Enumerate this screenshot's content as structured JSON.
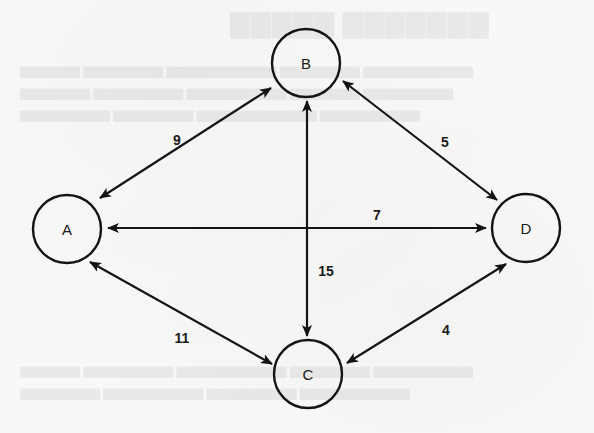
{
  "diagram": {
    "type": "weighted-undirected-graph",
    "background_color": "#f8f8f6",
    "stroke_color": "#141414",
    "node_radius": 34,
    "nodes": [
      {
        "id": "A",
        "label": "A",
        "cx": 67,
        "cy": 229
      },
      {
        "id": "B",
        "label": "B",
        "cx": 306,
        "cy": 63
      },
      {
        "id": "C",
        "label": "C",
        "cx": 308,
        "cy": 374
      },
      {
        "id": "D",
        "label": "D",
        "cx": 526,
        "cy": 228
      }
    ],
    "edges": [
      {
        "from": "A",
        "to": "B",
        "weight": "9",
        "x1": 100,
        "y1": 198,
        "x2": 271,
        "y2": 88,
        "lx": 177,
        "ly": 140
      },
      {
        "from": "B",
        "to": "D",
        "weight": "5",
        "x1": 343,
        "y1": 81,
        "x2": 497,
        "y2": 200,
        "lx": 445,
        "ly": 142
      },
      {
        "from": "A",
        "to": "D",
        "weight": "7",
        "x1": 108,
        "y1": 228,
        "x2": 486,
        "y2": 228,
        "lx": 377,
        "ly": 215
      },
      {
        "from": "B",
        "to": "C",
        "weight": "15",
        "x1": 307,
        "y1": 101,
        "x2": 307,
        "y2": 336,
        "lx": 326,
        "ly": 271
      },
      {
        "from": "A",
        "to": "C",
        "weight": "11",
        "x1": 90,
        "y1": 262,
        "x2": 272,
        "y2": 364,
        "lx": 182,
        "ly": 338
      },
      {
        "from": "C",
        "to": "D",
        "weight": "4",
        "x1": 347,
        "y1": 363,
        "x2": 506,
        "y2": 264,
        "lx": 446,
        "ly": 330
      }
    ]
  }
}
